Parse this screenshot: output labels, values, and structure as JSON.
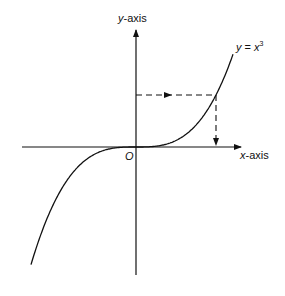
{
  "diagram": {
    "type": "function-graph",
    "curve_label": {
      "y": "y",
      "eq": " = ",
      "x": "x",
      "exp": "3"
    },
    "y_axis_label": {
      "var": "y",
      "suffix": "-axis"
    },
    "x_axis_label": {
      "var": "x",
      "suffix": "-axis"
    },
    "origin_label": "O",
    "colors": {
      "line": "#111111",
      "background": "#ffffff"
    }
  }
}
